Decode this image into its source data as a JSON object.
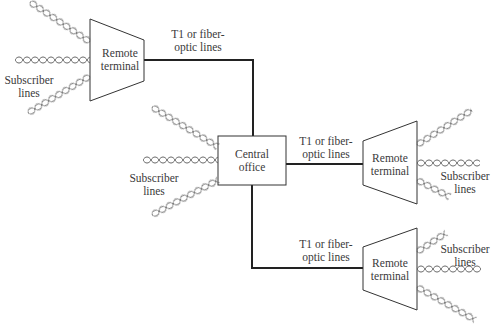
{
  "diagram": {
    "central_office": {
      "label_line1": "Central",
      "label_line2": "office"
    },
    "remote_terminals": [
      {
        "id": "rt-top-left",
        "label_line1": "Remote",
        "label_line2": "terminal"
      },
      {
        "id": "rt-middle-right",
        "label_line1": "Remote",
        "label_line2": "terminal"
      },
      {
        "id": "rt-bottom-right",
        "label_line1": "Remote",
        "label_line2": "terminal"
      }
    ],
    "trunk_labels": [
      {
        "line1": "T1 or fiber-",
        "line2": "optic lines"
      },
      {
        "line1": "T1 or fiber-",
        "line2": "optic lines"
      },
      {
        "line1": "T1 or fiber-",
        "line2": "optic lines"
      }
    ],
    "subscriber_labels": [
      {
        "line1": "Subscriber",
        "line2": "lines"
      },
      {
        "line1": "Subscriber",
        "line2": "lines"
      },
      {
        "line1": "Subscriber",
        "line2": "lines"
      },
      {
        "line1": "Subscriber",
        "line2": "lines"
      }
    ],
    "colors": {
      "line": "#222222",
      "twisted_pair": "#555555",
      "text": "#3a3a3a",
      "background": "#ffffff"
    }
  }
}
